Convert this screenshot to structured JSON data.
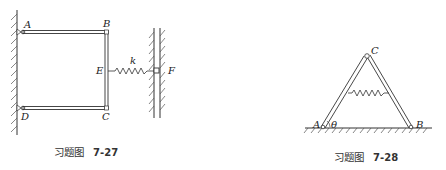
{
  "figures": [
    {
      "id": "7-27",
      "caption_prefix": "习题图",
      "caption_number": "7-27",
      "labels": {
        "A": "A",
        "B": "B",
        "C": "C",
        "D": "D",
        "E": "E",
        "F": "F",
        "k": "k"
      },
      "description": "Rectangular frame ABCD hinged to left wall at A and D, spring k connects midpoint E of side BC to slider F in vertical guide"
    },
    {
      "id": "7-28",
      "caption_prefix": "习题图",
      "caption_number": "7-28",
      "labels": {
        "A": "A",
        "B": "B",
        "C": "C",
        "theta": "θ"
      },
      "description": "Two bars AC and BC hinged at C forming a triangle on the ground, spring connecting the two bars, angle θ at A"
    }
  ],
  "colors": {
    "line": "#333333",
    "hatch": "#555555",
    "background": "#ffffff"
  }
}
